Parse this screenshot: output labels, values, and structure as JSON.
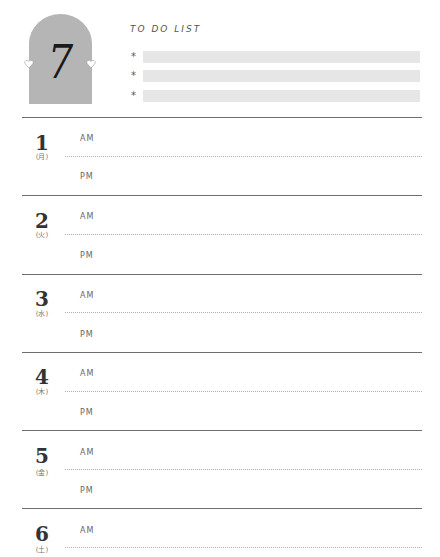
{
  "month": {
    "number": "7",
    "badge_color": "#b5b5b5"
  },
  "todo": {
    "title": "TO DO LIST",
    "bullet": "*",
    "items": [
      "",
      "",
      ""
    ],
    "bar_color": "#e6e6e6"
  },
  "labels": {
    "am": "AM",
    "pm": "PM"
  },
  "days": [
    {
      "day": "1",
      "weekday": "(月)"
    },
    {
      "day": "2",
      "weekday": "(火)"
    },
    {
      "day": "3",
      "weekday": "(水)"
    },
    {
      "day": "4",
      "weekday": "(木)"
    },
    {
      "day": "5",
      "weekday": "(金)"
    },
    {
      "day": "6",
      "weekday": "(土)"
    }
  ]
}
